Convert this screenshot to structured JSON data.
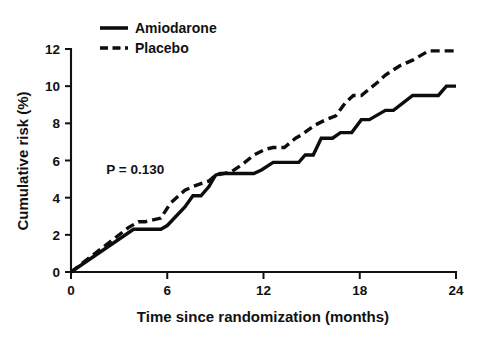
{
  "figure": {
    "background_color": "#ffffff",
    "line_color": "#0d0d0d"
  },
  "annotation": {
    "p_value_text": "P = 0.130"
  },
  "legend": {
    "position": "top-left",
    "entries": [
      {
        "label": "Amiodarone",
        "style": "solid",
        "icon": "solid-line-swatch"
      },
      {
        "label": "Placebo",
        "style": "dashed",
        "icon": "dashed-line-swatch"
      }
    ]
  },
  "chart_data": {
    "type": "line",
    "title": "",
    "subtitle": "",
    "xlabel": "Time since randomization (months)",
    "ylabel": "Cumulative risk (%)",
    "xlim": [
      0,
      24
    ],
    "ylim": [
      0,
      12
    ],
    "xticks": [
      0,
      6,
      12,
      18,
      24
    ],
    "yticks": [
      0,
      2,
      4,
      6,
      8,
      10,
      12
    ],
    "xtick_labels": [
      "0",
      "6",
      "12",
      "18",
      "24"
    ],
    "ytick_labels": [
      "0",
      "2",
      "4",
      "6",
      "8",
      "10",
      "12"
    ],
    "grid": false,
    "legend_position": "upper left",
    "annotations": [
      {
        "text": "P = 0.130",
        "x": 2.2,
        "y": 5.3
      }
    ],
    "series": [
      {
        "name": "Amiodarone",
        "style": "solid",
        "color": "#0d0d0d",
        "x": [
          0.0,
          3.9,
          5.6,
          6.0,
          7.1,
          7.6,
          8.1,
          8.6,
          9.0,
          9.3,
          11.4,
          11.9,
          12.6,
          13.1,
          14.2,
          14.6,
          15.1,
          15.6,
          16.3,
          16.8,
          17.5,
          18.1,
          18.6,
          19.6,
          20.1,
          21.3,
          21.8,
          22.9,
          23.4,
          24.0
        ],
        "y": [
          0.0,
          2.3,
          2.3,
          2.5,
          3.5,
          4.1,
          4.1,
          4.6,
          5.2,
          5.3,
          5.3,
          5.5,
          5.9,
          5.9,
          5.9,
          6.3,
          6.3,
          7.2,
          7.2,
          7.5,
          7.5,
          8.2,
          8.2,
          8.7,
          8.7,
          9.5,
          9.5,
          9.5,
          10.0,
          10.0
        ]
      },
      {
        "name": "Placebo",
        "style": "dashed",
        "color": "#0d0d0d",
        "x": [
          0.0,
          3.6,
          4.2,
          4.6,
          5.6,
          6.2,
          7.1,
          7.6,
          8.6,
          9.0,
          10.0,
          10.7,
          11.4,
          12.1,
          12.6,
          13.3,
          14.0,
          14.4,
          15.2,
          15.9,
          16.5,
          17.1,
          17.6,
          18.1,
          19.1,
          19.6,
          20.5,
          21.3,
          22.3,
          24.0
        ],
        "y": [
          0.0,
          2.4,
          2.7,
          2.7,
          2.9,
          3.7,
          4.4,
          4.6,
          4.9,
          5.2,
          5.4,
          5.8,
          6.3,
          6.6,
          6.7,
          6.7,
          7.2,
          7.4,
          7.9,
          8.2,
          8.4,
          9.1,
          9.5,
          9.5,
          10.2,
          10.6,
          11.1,
          11.4,
          11.9,
          11.9
        ]
      }
    ]
  }
}
